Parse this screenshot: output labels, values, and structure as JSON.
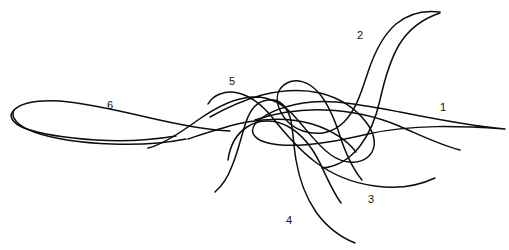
{
  "figure": {
    "background_color": "#ffffff",
    "ink_color": "#0d0d0d",
    "width": 509,
    "height": 250,
    "kind": "line-trace-drawing"
  },
  "labels": [
    {
      "id": "1",
      "text": "1",
      "x": 440,
      "y": 102
    },
    {
      "id": "2",
      "text": "2",
      "x": 357,
      "y": 30
    },
    {
      "id": "3",
      "text": "3",
      "x": 368,
      "y": 194
    },
    {
      "id": "4",
      "text": "4",
      "x": 286,
      "y": 215
    },
    {
      "id": "5",
      "text": "5",
      "x": 229,
      "y": 76
    },
    {
      "id": "6",
      "text": "6",
      "x": 107,
      "y": 100
    }
  ],
  "traces": [
    {
      "id": "trace-1",
      "label": "1",
      "stroke_width": 1.5,
      "d": "M505,129 C470,126 430,118 400,112 C368,106 338,100 312,102 C288,104 268,112 258,121 C248,130 252,139 268,143 C292,149 330,143 368,134 C412,124 460,126 505,129 Z"
    },
    {
      "id": "trace-2",
      "label": "2",
      "stroke_width": 1.5,
      "d": "M440,12 C424,10 408,14 396,24 C382,36 374,54 368,72 C361,93 356,110 344,122 C333,133 318,136 303,131 C291,127 283,118 279,108 C275,97 278,88 287,83 C297,78 309,82 318,92 C328,103 334,118 339,133 C345,152 352,168 362,180"
    },
    {
      "id": "trace-3",
      "label": "3",
      "stroke_width": 1.5,
      "d": "M435,178 C418,186 396,189 375,186 C352,183 331,174 314,161 C296,147 283,131 272,117 C262,105 251,96 238,93 C225,90 213,95 208,104"
    },
    {
      "id": "trace-4",
      "label": "4",
      "stroke_width": 1.5,
      "d": "M355,243 C340,237 326,226 316,212 C305,196 299,178 296,160 C293,142 293,127 290,117 C286,105 278,99 268,100 C257,101 250,110 246,122 C241,137 238,152 232,166 C228,177 222,186 215,192"
    },
    {
      "id": "trace-5",
      "label": "5",
      "stroke_width": 1.5,
      "d": "M210,117 C226,108 244,100 262,95 C282,90 302,89 320,93 C340,98 356,109 366,122 C376,135 377,148 369,156 C360,165 344,164 331,155 C317,145 307,130 296,118 C284,104 269,96 252,97 C234,98 215,108 198,120 C180,133 162,145 148,148"
    },
    {
      "id": "trace-6",
      "label": "6",
      "stroke_width": 1.5,
      "d": "M176,136 C152,140 124,142 96,140 C66,138 40,134 24,128 C12,123 8,116 14,110 C21,103 38,100 60,101 C86,103 116,110 146,117 C176,124 204,130 230,131"
    },
    {
      "id": "trace-6-lower",
      "label": "6",
      "stroke_width": 1.5,
      "d": "M14,110 C10,118 18,126 34,132 C54,139 82,143 112,144 C140,145 166,143 186,139"
    },
    {
      "id": "trace-center-loop-a",
      "label": "5",
      "stroke_width": 1.5,
      "d": "M188,139 C206,133 226,126 247,122 C270,118 292,118 312,124 C332,130 348,141 356,152"
    },
    {
      "id": "trace-center-loop-b",
      "label": "3",
      "stroke_width": 1.5,
      "d": "M228,160 C230,146 236,134 247,127 C259,119 275,119 289,127 C303,135 313,149 320,163 C327,178 333,192 341,203"
    },
    {
      "id": "trace-arc-right",
      "label": "1",
      "stroke_width": 1.5,
      "d": "M255,120 C276,113 300,109 325,110 C352,111 378,117 399,126 C420,135 440,145 460,150"
    },
    {
      "id": "trace-tail-2b",
      "label": "2",
      "stroke_width": 1.5,
      "d": "M440,13 C422,19 408,30 399,45 C389,62 384,82 380,100 C376,118 370,133 360,146 C350,159 336,167 322,168"
    }
  ]
}
